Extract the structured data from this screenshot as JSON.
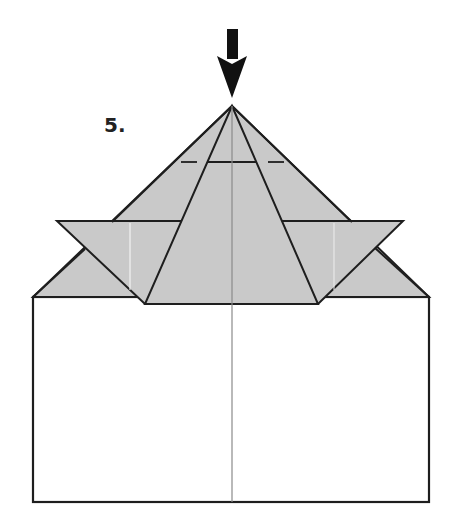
{
  "diagram": {
    "step_label": "5.",
    "colors": {
      "paper_fill": "#c9c9c9",
      "paper_white": "#ffffff",
      "line": "#1e1e1e",
      "crease": "#8a8a8a",
      "arrow": "#111111"
    },
    "arrow": {
      "direction": "down",
      "tip": [
        232,
        98
      ]
    },
    "apex": [
      232,
      106
    ],
    "rectangle": {
      "x": 33,
      "y": 297,
      "width": 396,
      "height": 205
    },
    "wing_line_y": 221,
    "trapezoid_base": {
      "y": 304,
      "left_x": 145,
      "right_x": 318
    },
    "crease_line_y": 162
  }
}
